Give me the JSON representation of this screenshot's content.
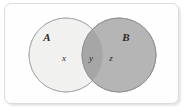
{
  "figure": {
    "kind": "venn-diagram",
    "sets_count": 2,
    "frame": {
      "border_color": "#dcdcdc",
      "background_color": "#fefefe",
      "corner_radius_px": 7
    },
    "sets": [
      {
        "id": "A",
        "label": "A",
        "fill_color": "#f1f1f0",
        "stroke_color": "#b9b9b9",
        "label_x": 47,
        "label_y": 41,
        "center_x": 66,
        "center_y": 55,
        "radius": 37
      },
      {
        "id": "B",
        "label": "B",
        "fill_color": "#b5b5b5",
        "stroke_color": "#9a9a9a",
        "label_x": 126,
        "label_y": 41,
        "center_x": 119,
        "center_y": 55,
        "radius": 37
      }
    ],
    "overlap": {
      "fill_color": "#a6a6a6",
      "stroke_color": "#8e8e8e"
    },
    "regions": [
      {
        "id": "x",
        "label": "x",
        "meaning": "A only",
        "x": 64,
        "y": 61
      },
      {
        "id": "y",
        "label": "y",
        "meaning": "A intersect B",
        "x": 91,
        "y": 61
      },
      {
        "id": "z",
        "label": "z",
        "meaning": "B only",
        "x": 111,
        "y": 61
      }
    ]
  }
}
